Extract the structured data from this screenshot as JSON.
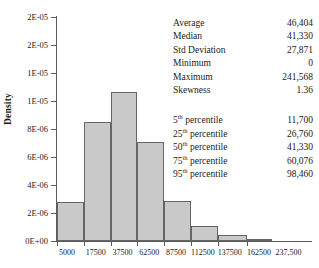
{
  "chart_data": {
    "type": "bar",
    "title": "",
    "xlabel": "",
    "ylabel": "Density",
    "grid": false,
    "legend": "none",
    "ylim": [
      0,
      2e-05
    ],
    "ytick_values": [
      0,
      2.5e-06,
      5e-06,
      7.5e-06,
      1e-05,
      1.25e-05,
      1.5e-05,
      1.75e-05,
      2e-05
    ],
    "ytick_labels": [
      "0E+00",
      "2E-06",
      "4E-06",
      "6E-06",
      "8E-06",
      "1E-05",
      "1E-05",
      "2E-05",
      "2E-05"
    ],
    "xtick_labels": [
      "5000",
      "17500",
      "37500",
      "62500",
      "87500",
      "112500",
      "137500",
      "162500",
      "237,500"
    ],
    "categories": [
      "5000",
      "17500",
      "37500",
      "62500",
      "87500",
      "112500",
      "137500",
      "162500"
    ],
    "values": [
      3.5e-06,
      1.06e-05,
      1.33e-05,
      8.8e-06,
      3.6e-06,
      1.3e-06,
      5e-07,
      1.5e-07
    ],
    "bar_color": "#c9c9c9",
    "bar_edge_color": "#666666",
    "axis_color": "#5b5b5b"
  },
  "stats": {
    "summary": [
      {
        "label": "Average",
        "value": "46,404"
      },
      {
        "label": "Median",
        "value": "41,330"
      },
      {
        "label": "Std Deviation",
        "value": "27,871"
      },
      {
        "label": "Minimum",
        "value": "0"
      },
      {
        "label": "Maximum",
        "value": "241,568"
      },
      {
        "label": "Skewness",
        "value": "1.36"
      }
    ],
    "percentiles": [
      {
        "label": "5",
        "suffix": "th",
        "label_tail": " percentile",
        "value": "11,700"
      },
      {
        "label": "25",
        "suffix": "th",
        "label_tail": " percentile",
        "value": "26,760"
      },
      {
        "label": "50",
        "suffix": "th",
        "label_tail": " percentile",
        "value": "41,330"
      },
      {
        "label": "75",
        "suffix": "th",
        "label_tail": " percentile",
        "value": "60,076"
      },
      {
        "label": "95",
        "suffix": "th",
        "label_tail": " percentile",
        "value": "98,460"
      }
    ]
  }
}
